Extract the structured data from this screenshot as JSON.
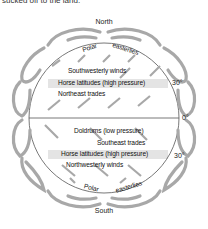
{
  "caption": "sucked off to the land.",
  "poles": {
    "north": "North",
    "south": "South"
  },
  "northern_hemisphere": {
    "polar_words": [
      "Polar",
      "easterlies"
    ],
    "labels": [
      "Southwesterly winds",
      "Horse latitudes (high pressure)",
      "Northeast trades"
    ]
  },
  "southern_hemisphere": {
    "polar_words": [
      "Polar",
      "easterlies"
    ],
    "labels": [
      "Doldrums (low pressure)",
      "Southeast trades",
      "Horse latitudes (high pressure)",
      "Northwesterly winds"
    ]
  },
  "latitudes": {
    "north_30": "30°",
    "equator": "0°",
    "south_30": "30°"
  },
  "colors": {
    "arrow": "#a8a8a8",
    "band": "#e4e4e4",
    "outline": "#555555"
  }
}
